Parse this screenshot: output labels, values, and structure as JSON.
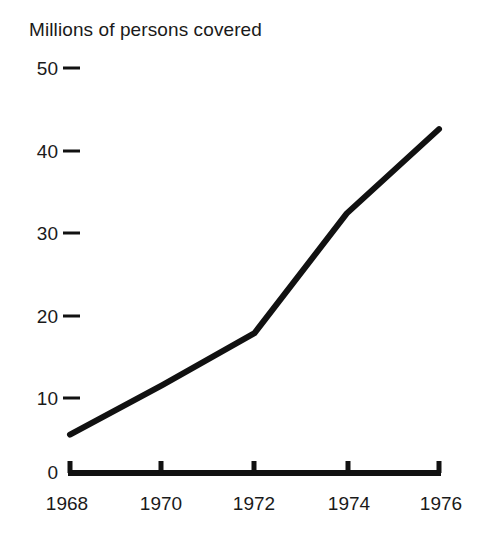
{
  "chart_data": {
    "type": "line",
    "title": "Millions of persons covered",
    "xlabel": "",
    "ylabel": "",
    "x": [
      1968,
      1970,
      1972,
      1974,
      1976
    ],
    "categories": [
      "1968",
      "1970",
      "1972",
      "1974",
      "1976"
    ],
    "values": [
      5.6,
      11.6,
      17.9,
      32.4,
      42.6
    ],
    "series": [
      {
        "name": "Millions of persons covered",
        "values": [
          5.6,
          11.6,
          17.9,
          32.4,
          42.6
        ]
      }
    ],
    "ylim": [
      0,
      50
    ],
    "xlim": [
      1968,
      1976
    ],
    "yticks": [
      0,
      10,
      20,
      30,
      40,
      50
    ],
    "ytick_labels": [
      "0",
      "10",
      "20",
      "30",
      "40",
      "50"
    ],
    "xticks": [
      1968,
      1970,
      1972,
      1974,
      1976
    ],
    "xtick_labels": [
      "1968",
      "1970",
      "1972",
      "1974",
      "1976"
    ],
    "grid": false,
    "legend": false,
    "legend_position": "none",
    "line_color": "#111111",
    "line_width": 6,
    "axis_color": "#111111",
    "background_color": "#ffffff"
  },
  "axes": {
    "y": {
      "tick_0": "0",
      "tick_10": "10",
      "tick_20": "20",
      "tick_30": "30",
      "tick_40": "40",
      "tick_50": "50"
    },
    "x": {
      "tick_1968": "1968",
      "tick_1970": "1970",
      "tick_1972": "1972",
      "tick_1974": "1974",
      "tick_1976": "1976"
    }
  },
  "icons": {
    "ytick_dash": "ytick-dash-icon",
    "xtick_mark": "xtick-mark-icon"
  }
}
